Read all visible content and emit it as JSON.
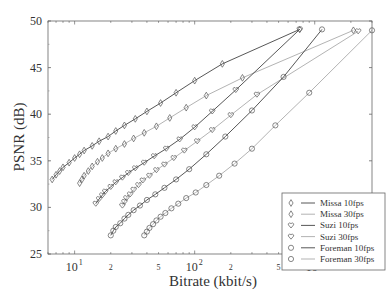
{
  "chart_data": {
    "type": "line",
    "title": "",
    "xlabel": "Bitrate (kbit/s)",
    "ylabel": "PSNR (dB)",
    "xscale": "log",
    "xlim": [
      6,
      3000
    ],
    "ylim": [
      25,
      50
    ],
    "grid": false,
    "legend_position": "lower right",
    "x_major_ticks": [
      {
        "value": 10,
        "label": "10",
        "exp": "1"
      },
      {
        "value": 100,
        "label": "10",
        "exp": "2"
      },
      {
        "value": 1000,
        "label": "10",
        "exp": "3"
      }
    ],
    "x_minor_labels": [
      {
        "value": 20,
        "label": "2"
      },
      {
        "value": 50,
        "label": "5"
      },
      {
        "value": 200,
        "label": "2"
      },
      {
        "value": 500,
        "label": "5"
      },
      {
        "value": 2000,
        "label": "2"
      }
    ],
    "y_ticks": [
      25,
      30,
      35,
      40,
      45,
      50
    ],
    "series": [
      {
        "name": "Missa 10fps",
        "marker": "diamond",
        "line": "#444444",
        "x": [
          6.5,
          7,
          7.5,
          8,
          9,
          10,
          11,
          12,
          14,
          16,
          19,
          22,
          26,
          32,
          40,
          52,
          70,
          100,
          170,
          750
        ],
        "y": [
          33.0,
          33.5,
          33.9,
          34.3,
          34.8,
          35.3,
          35.7,
          36.1,
          36.6,
          37.1,
          37.6,
          38.2,
          38.8,
          39.5,
          40.3,
          41.2,
          42.3,
          43.6,
          45.4,
          49.1
        ]
      },
      {
        "name": "Missa 30fps",
        "marker": "diamond",
        "line": "#aaaaaa",
        "x": [
          11,
          11.5,
          12,
          13,
          14,
          15.5,
          17,
          19,
          22,
          26,
          31,
          38,
          48,
          62,
          85,
          125,
          250,
          2100
        ],
        "y": [
          32.6,
          33.0,
          33.4,
          33.9,
          34.4,
          34.9,
          35.3,
          35.8,
          36.3,
          36.8,
          37.4,
          38.0,
          38.7,
          39.6,
          40.7,
          42.0,
          43.9,
          49.0
        ]
      },
      {
        "name": "Suzi 10fps",
        "marker": "heart",
        "line": "#444444",
        "x": [
          15,
          16,
          17,
          18,
          20,
          22,
          25,
          28,
          32,
          38,
          46,
          58,
          75,
          100,
          140,
          220,
          750
        ],
        "y": [
          30.4,
          30.9,
          31.3,
          31.7,
          32.2,
          32.7,
          33.2,
          33.7,
          34.2,
          34.8,
          35.5,
          36.3,
          37.3,
          38.6,
          40.3,
          42.6,
          49.1
        ]
      },
      {
        "name": "Suzi 30fps",
        "marker": "heart",
        "line": "#aaaaaa",
        "x": [
          25,
          26,
          27,
          29,
          31,
          34,
          37,
          42,
          48,
          56,
          67,
          82,
          105,
          140,
          200,
          330,
          2300
        ],
        "y": [
          30.2,
          30.6,
          31.0,
          31.4,
          31.9,
          32.4,
          32.9,
          33.4,
          34.0,
          34.6,
          35.3,
          36.1,
          37.1,
          38.3,
          39.9,
          42.1,
          48.9
        ]
      },
      {
        "name": "Foreman 10fps",
        "marker": "circle",
        "line": "#444444",
        "x": [
          20,
          21,
          22,
          24,
          26,
          28,
          31,
          35,
          40,
          47,
          56,
          70,
          90,
          125,
          180,
          300,
          550,
          1150
        ],
        "y": [
          27.0,
          27.5,
          27.9,
          28.3,
          28.8,
          29.2,
          29.7,
          30.2,
          30.8,
          31.4,
          32.1,
          33.0,
          34.1,
          35.7,
          37.6,
          40.4,
          44.0,
          49.1
        ]
      },
      {
        "name": "Foreman 30fps",
        "marker": "circle",
        "line": "#aaaaaa",
        "x": [
          38,
          40,
          42,
          45,
          48,
          52,
          57,
          64,
          73,
          85,
          102,
          125,
          160,
          215,
          300,
          470,
          900,
          3000
        ],
        "y": [
          27.0,
          27.4,
          27.8,
          28.2,
          28.6,
          29.0,
          29.4,
          29.9,
          30.4,
          31.0,
          31.6,
          32.4,
          33.4,
          34.7,
          36.3,
          38.8,
          42.3,
          49.0
        ]
      }
    ]
  }
}
